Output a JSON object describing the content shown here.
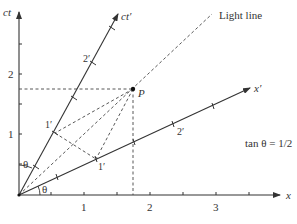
{
  "diagram": {
    "type": "spacetime-diagram",
    "axes": {
      "x_label": "x",
      "ct_label": "ct",
      "x_prime_label": "x′",
      "ct_prime_label": "ct′",
      "x_ticks": [
        "1",
        "2",
        "3"
      ],
      "ct_ticks": [
        "1",
        "2"
      ]
    },
    "primed_ticks": {
      "ct_prime": [
        "1′",
        "2′"
      ],
      "x_prime": [
        "1′",
        "2′"
      ]
    },
    "light_line_label": "Light line",
    "point_label": "P",
    "angle_label": "θ",
    "angle_label_2": "θ",
    "equation": "tan θ = 1/2",
    "colors": {
      "line": "#333333",
      "background": "#ffffff"
    }
  }
}
